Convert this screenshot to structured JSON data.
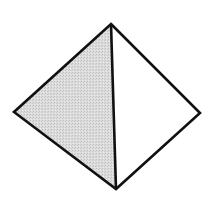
{
  "diagram": {
    "type": "pyramid-tetrahedron",
    "vertices": {
      "top": [
        111,
        24
      ],
      "left": [
        14,
        112
      ],
      "right": [
        200,
        113
      ],
      "bottom": [
        116,
        189
      ]
    },
    "faces": [
      {
        "name": "left-face",
        "fill": "#d9d9d9",
        "shaded": true
      },
      {
        "name": "right-face",
        "fill": "#ffffff",
        "shaded": false
      }
    ],
    "stroke_color": "#111111",
    "stroke_width": 2.6,
    "background": "#ffffff"
  }
}
